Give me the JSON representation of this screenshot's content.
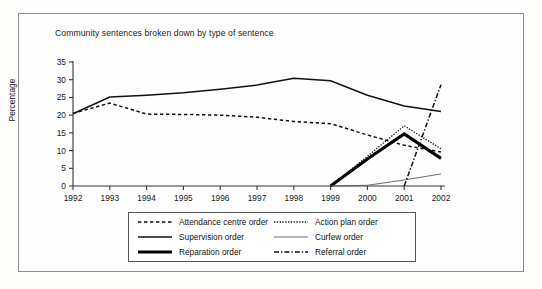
{
  "chart_data": {
    "type": "line",
    "title": "Community sentences broken down by type of sentence",
    "xlabel": "",
    "ylabel": "Percentage",
    "categories": [
      "1992",
      "1993",
      "1994",
      "1995",
      "1996",
      "1997",
      "1998",
      "1999",
      "2000",
      "2001",
      "2002"
    ],
    "x": [
      1992,
      1993,
      1994,
      1995,
      1996,
      1997,
      1998,
      1999,
      2000,
      2001,
      2002
    ],
    "xlim": [
      1992,
      2002
    ],
    "ylim": [
      0,
      35
    ],
    "yticks": [
      "0",
      "5",
      "10",
      "15",
      "20",
      "25",
      "30",
      "35"
    ],
    "grid": false,
    "legend_position": "bottom",
    "series": [
      {
        "name": "Attendance centre order",
        "style": "dashed",
        "values": [
          20.5,
          23.4,
          20.3,
          20.2,
          20.0,
          19.4,
          18.2,
          17.6,
          14.4,
          11.5,
          9.6
        ]
      },
      {
        "name": "Supervision order",
        "style": "solid",
        "values": [
          20.4,
          25.1,
          25.6,
          26.3,
          27.3,
          28.5,
          30.4,
          29.7,
          25.6,
          22.6,
          21.0
        ]
      },
      {
        "name": "Reparation order",
        "style": "solid-thick",
        "values": [
          null,
          null,
          null,
          null,
          null,
          null,
          null,
          0.0,
          7.6,
          14.7,
          7.8
        ]
      },
      {
        "name": "Action plan order",
        "style": "dotted",
        "values": [
          null,
          null,
          null,
          null,
          null,
          null,
          null,
          0.0,
          8.4,
          17.0,
          10.5
        ]
      },
      {
        "name": "Curfew order",
        "style": "thin-solid",
        "values": [
          null,
          null,
          null,
          null,
          null,
          null,
          null,
          0.0,
          0.2,
          1.7,
          3.4
        ]
      },
      {
        "name": "Referral order",
        "style": "dash-dot",
        "values": [
          null,
          null,
          null,
          null,
          null,
          null,
          null,
          null,
          null,
          0.0,
          28.6
        ]
      }
    ],
    "annotations": []
  },
  "legend": {
    "items": [
      {
        "label": "Attendance centre order",
        "swatch": "dashed-line-swatch"
      },
      {
        "label": "Action plan order",
        "swatch": "dotted-line-swatch"
      },
      {
        "label": "Supervision order",
        "swatch": "solid-line-swatch"
      },
      {
        "label": "Curfew order",
        "swatch": "thin-solid-line-swatch"
      },
      {
        "label": "Reparation order",
        "swatch": "thick-solid-line-swatch"
      },
      {
        "label": "Referral order",
        "swatch": "dash-dot-line-swatch"
      }
    ]
  },
  "colors": {
    "ink": "#111111",
    "frame": "#8b8b8b",
    "axis": "#333333",
    "background": "#fefefe"
  }
}
